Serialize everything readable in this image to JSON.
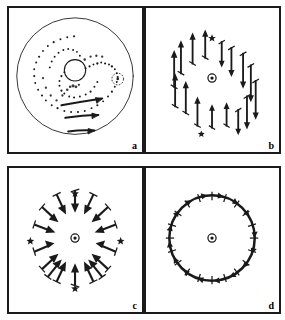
{
  "figure": {
    "background_color": "#ffffff",
    "ink_color": "#1a1a1a",
    "panel_border_color": "#1a1a1a",
    "panel_count": 4,
    "layout": "2x2 grid of bordered panels",
    "caption_labels": [
      "a",
      "b",
      "c",
      "d"
    ]
  },
  "panels": [
    {
      "id": "panel-a",
      "label": "a",
      "title": "spiral structure with shear flow arrows",
      "center_marker": "small-open-circle",
      "outer_circle": {
        "cx": 68,
        "cy": 70,
        "r": 60
      },
      "inner_circle": {
        "cx": 68,
        "cy": 64,
        "r": 11
      },
      "companion_circle": {
        "cx": 112,
        "cy": 73,
        "r": 6
      },
      "spiral_arms": 2,
      "spiral_style": "stippled-dotted",
      "flow_arrows": [
        {
          "name": "shear-arrow-1",
          "x1": 54,
          "y1": 99,
          "x2": 99,
          "y2": 94,
          "length": 45
        },
        {
          "name": "shear-arrow-2",
          "x1": 58,
          "y1": 113,
          "x2": 95,
          "y2": 111,
          "length": 37
        },
        {
          "name": "shear-arrow-3",
          "x1": 60,
          "y1": 127,
          "x2": 90,
          "y2": 126,
          "length": 30
        }
      ]
    },
    {
      "id": "panel-b",
      "label": "b",
      "title": "vertical dipole vector field",
      "center_marker": "circle-with-dot",
      "center": {
        "cx": 68,
        "cy": 72
      },
      "field_type": "vertical-shear-dipole",
      "ring_radius": 46,
      "vector_count": 22,
      "description": "arrows on left half point up, arrows on right half point down"
    },
    {
      "id": "panel-c",
      "label": "c",
      "title": "radial convergent vector field",
      "center_marker": "circle-with-dot",
      "center": {
        "cx": 68,
        "cy": 72
      },
      "field_type": "radial-inward",
      "ring_radius": 46,
      "vector_count": 16,
      "description": "arrows arranged radially all pointing inward toward the center"
    },
    {
      "id": "panel-d",
      "label": "d",
      "title": "tangential rotational vector field",
      "center_marker": "circle-with-dot",
      "center": {
        "cx": 68,
        "cy": 72
      },
      "field_type": "tangential-clockwise",
      "ring_radius": 44,
      "vector_count": 40,
      "description": "dense ring of tangential arrows forming a closed circular flow"
    }
  ]
}
